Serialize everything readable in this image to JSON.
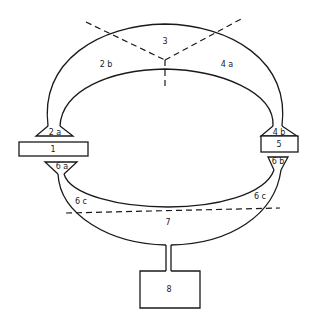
{
  "diagram": {
    "labels": {
      "box_1": "1",
      "region_2a": "2 a",
      "region_2b": "2 b",
      "region_3": "3",
      "region_4a": "4 a",
      "region_4b": "4 b",
      "box_5": "5",
      "region_6a": "6 a",
      "region_6b": "6 b",
      "region_6c_left": "6 c",
      "region_6c_right": "6 c",
      "region_7": "7",
      "box_8": "8"
    }
  }
}
